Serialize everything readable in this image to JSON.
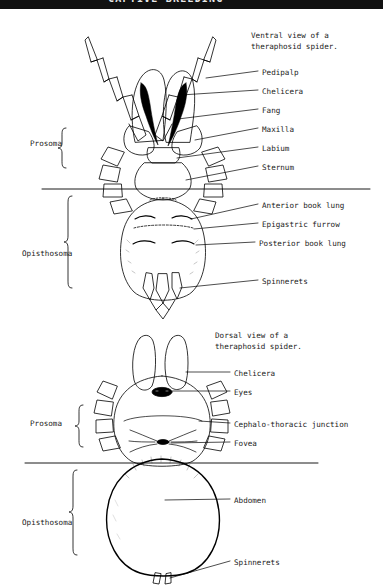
{
  "page": {
    "header_strip_text": "CAPTIVE BREEDING",
    "background_color": "#ffffff",
    "ink_color": "#000000",
    "width": 383,
    "height": 585
  },
  "figures": [
    {
      "id": "ventral",
      "caption_line1": "Ventral view of a",
      "caption_line2": "theraphosid spider.",
      "body_regions": [
        {
          "name": "Prosoma",
          "label": "Prosoma"
        },
        {
          "name": "Opisthosoma",
          "label": "Opisthosoma"
        }
      ],
      "callouts": [
        {
          "label": "Pedipalp",
          "y": 72
        },
        {
          "label": "Chelicera",
          "y": 91
        },
        {
          "label": "Fang",
          "y": 110
        },
        {
          "label": "Maxilla",
          "y": 129
        },
        {
          "label": "Labium",
          "y": 148
        },
        {
          "label": "Sternum",
          "y": 167
        },
        {
          "label": "Anterior book lung",
          "y": 205
        },
        {
          "label": "Epigastric furrow",
          "y": 224
        },
        {
          "label": "Posterior book lung",
          "y": 243
        },
        {
          "label": "Spinnerets",
          "y": 281
        }
      ]
    },
    {
      "id": "dorsal",
      "caption_line1": "Dorsal view of a",
      "caption_line2": "theraphosid spider.",
      "body_regions": [
        {
          "name": "Prosoma",
          "label": "Prosoma"
        },
        {
          "name": "Opisthosoma",
          "label": "Opisthosoma"
        }
      ],
      "callouts": [
        {
          "label": "Chelicera",
          "y": 373
        },
        {
          "label": "Eyes",
          "y": 392
        },
        {
          "label": "Cephalo-thoracic junction",
          "y": 424
        },
        {
          "label": "Fovea",
          "y": 443
        },
        {
          "label": "Abdomen",
          "y": 500
        },
        {
          "label": "Spinnerets",
          "y": 562
        }
      ]
    }
  ]
}
